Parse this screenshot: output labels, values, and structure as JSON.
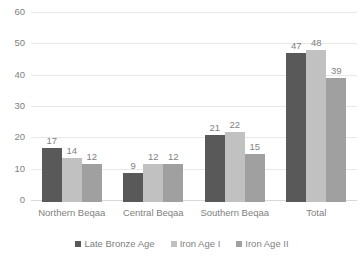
{
  "chart_data": {
    "type": "bar",
    "title": "",
    "subtitle": "",
    "xlabel": "",
    "ylabel": "",
    "ylim": [
      0,
      60
    ],
    "ytick_step": 10,
    "yticks": [
      "60",
      "50",
      "40",
      "30",
      "20",
      "10",
      "0"
    ],
    "grid": true,
    "legend_position": "bottom",
    "categories": [
      "Northern Beqaa",
      "Central Beqaa",
      "Southern Beqaa",
      "Total"
    ],
    "series": [
      {
        "name": "Late Bronze Age",
        "color": "#595959",
        "values": [
          17,
          9,
          21,
          47
        ]
      },
      {
        "name": "Iron Age I",
        "color": "#c1c1c1",
        "values": [
          14,
          12,
          22,
          48
        ]
      },
      {
        "name": "Iron Age II",
        "color": "#a0a0a0",
        "values": [
          12,
          12,
          15,
          39
        ]
      }
    ],
    "data_labels": [
      [
        "17",
        "14",
        "12"
      ],
      [
        "9",
        "12",
        "12"
      ],
      [
        "21",
        "22",
        "15"
      ],
      [
        "47",
        "48",
        "39"
      ]
    ],
    "colors": {
      "gridline": "#e8e8e8",
      "axis_text": "#7f7f7f",
      "background": "#ffffff"
    }
  }
}
